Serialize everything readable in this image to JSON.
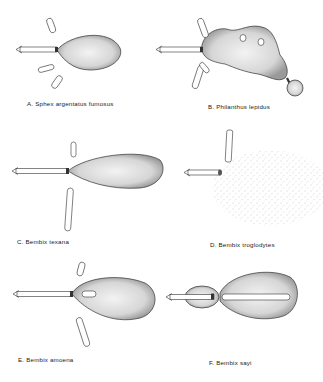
{
  "figure": {
    "panels": [
      {
        "id": "A",
        "label": "A. Sphex argentatus fumosus"
      },
      {
        "id": "B",
        "label": "B. Philanthus lepidus"
      },
      {
        "id": "C",
        "label": "C. Bembix texana"
      },
      {
        "id": "D",
        "label": "D. Bembix troglodytes"
      },
      {
        "id": "E",
        "label": "E. Bembix amoena"
      },
      {
        "id": "F",
        "label": "F. Bembix sayi"
      }
    ]
  }
}
